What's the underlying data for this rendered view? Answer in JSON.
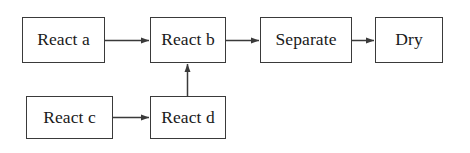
{
  "diagram": {
    "canvas": {
      "width": 470,
      "height": 153,
      "background": "#ffffff"
    },
    "style": {
      "border_color": "#3a3a3a",
      "edge_color": "#3a3a3a",
      "text_color": "#1a1a1a",
      "font_size_px": 17.5
    },
    "nodes": [
      {
        "id": "react-a",
        "label": "React a",
        "x": 22,
        "y": 17,
        "width": 83,
        "height": 46,
        "row": "top"
      },
      {
        "id": "react-b",
        "label": "React b",
        "x": 150,
        "y": 17,
        "width": 76,
        "height": 46,
        "row": "top"
      },
      {
        "id": "separate",
        "label": "Separate",
        "x": 260,
        "y": 17,
        "width": 92,
        "height": 46,
        "row": "top"
      },
      {
        "id": "dry",
        "label": "Dry",
        "x": 375,
        "y": 17,
        "width": 68,
        "height": 46,
        "row": "top"
      },
      {
        "id": "react-c",
        "label": "React c",
        "x": 26,
        "y": 96,
        "width": 87,
        "height": 43,
        "row": "bottom"
      },
      {
        "id": "react-d",
        "label": "React d",
        "x": 150,
        "y": 96,
        "width": 76,
        "height": 43,
        "row": "bottom"
      }
    ],
    "edges": [
      {
        "id": "edge-a-to-b",
        "from": "react-a",
        "to": "react-b",
        "direction": "right",
        "arrowhead": true
      },
      {
        "id": "edge-b-to-separate",
        "from": "react-b",
        "to": "separate",
        "direction": "right",
        "arrowhead": true
      },
      {
        "id": "edge-separate-to-dry",
        "from": "separate",
        "to": "dry",
        "direction": "right",
        "arrowhead": true
      },
      {
        "id": "edge-c-to-d",
        "from": "react-c",
        "to": "react-d",
        "direction": "right",
        "arrowhead": true
      },
      {
        "id": "edge-d-to-b",
        "from": "react-d",
        "to": "react-b",
        "direction": "up",
        "arrowhead": true
      }
    ]
  }
}
